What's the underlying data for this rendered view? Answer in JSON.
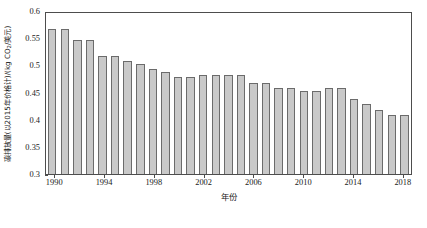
{
  "chart_data": {
    "type": "bar",
    "title": "",
    "xlabel": "年份",
    "ylabel": "碳排放量(以2015年价格计)/(kg CO₂/美元)",
    "ylabel_prefix": "碳排放量(以2015年价格计)/(kg CO",
    "ylabel_sub": "2",
    "ylabel_suffix": "/美元)",
    "ylim": [
      0.3,
      0.6
    ],
    "yticks": [
      "0.3",
      "0.35",
      "0.4",
      "0.45",
      "0.5",
      "0.55",
      "0.6"
    ],
    "ytick_values": [
      0.3,
      0.35,
      0.4,
      0.45,
      0.5,
      0.55,
      0.6
    ],
    "xticks": [
      "1990",
      "1994",
      "1998",
      "2002",
      "2006",
      "2010",
      "2014",
      "2018"
    ],
    "xtick_values": [
      1990,
      1994,
      1998,
      2002,
      2006,
      2010,
      2014,
      2018
    ],
    "grid": false,
    "legend": null,
    "bar_color": "#c9c9c9",
    "bar_edge_color": "#6b6b6b",
    "categories": [
      1990,
      1991,
      1992,
      1993,
      1994,
      1995,
      1996,
      1997,
      1998,
      1999,
      2000,
      2001,
      2002,
      2003,
      2004,
      2005,
      2006,
      2007,
      2008,
      2009,
      2010,
      2011,
      2012,
      2013,
      2014,
      2015,
      2016,
      2017,
      2018
    ],
    "values": [
      0.57,
      0.57,
      0.55,
      0.55,
      0.52,
      0.52,
      0.51,
      0.505,
      0.495,
      0.49,
      0.48,
      0.48,
      0.485,
      0.485,
      0.485,
      0.485,
      0.47,
      0.47,
      0.46,
      0.46,
      0.455,
      0.455,
      0.46,
      0.46,
      0.44,
      0.43,
      0.42,
      0.41,
      0.41
    ]
  }
}
